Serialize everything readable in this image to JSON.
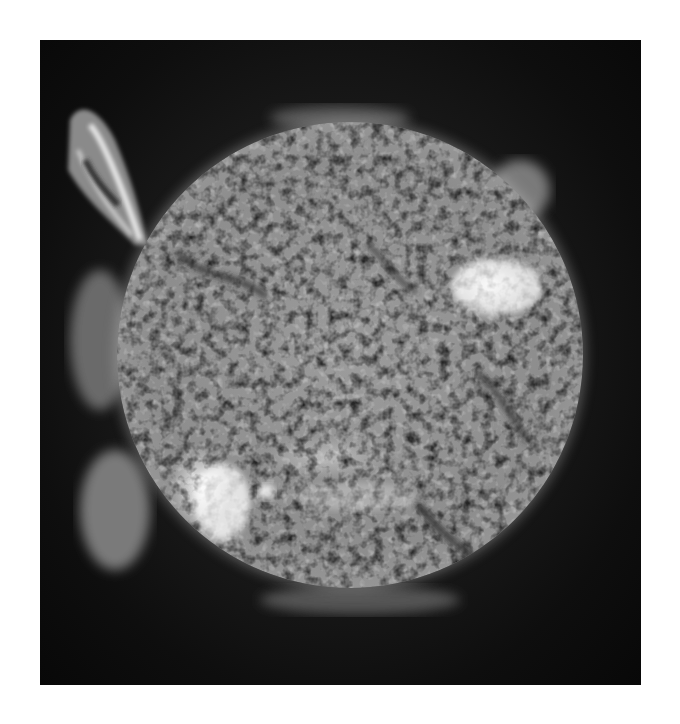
{
  "image": {
    "subject": "Sun (solar disk) with corona and prominence",
    "colors": {
      "page_background": "#ffffff",
      "space": "#111111",
      "solar_disk": "#9a9a9a",
      "active_regions": "#f2f2f2"
    }
  }
}
